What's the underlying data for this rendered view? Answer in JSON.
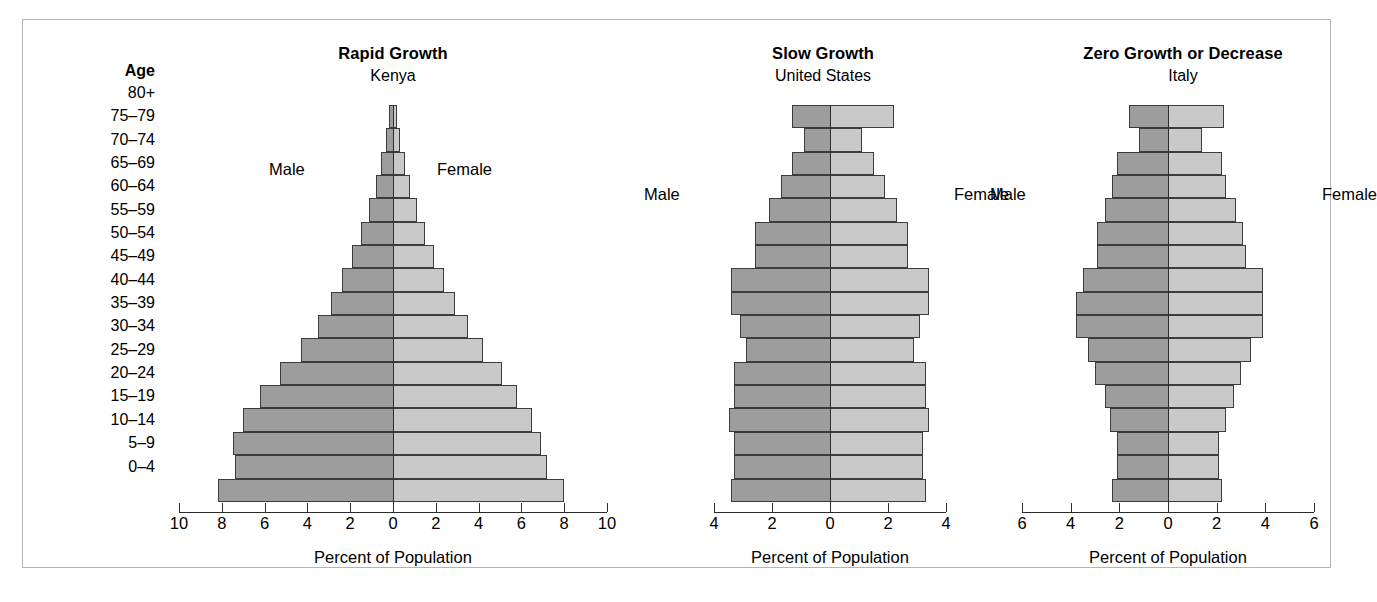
{
  "figure": {
    "age_heading": "Age",
    "age_groups": [
      "80+",
      "75–79",
      "70–74",
      "65–69",
      "60–64",
      "55–59",
      "50–54",
      "45–49",
      "40–44",
      "35–39",
      "30–34",
      "25–29",
      "20–24",
      "15–19",
      "10–14",
      "5–9",
      "0–4"
    ],
    "male_label": "Male",
    "female_label": "Female",
    "axis_title": "Percent of Population",
    "colors": {
      "male_fill": "#9d9d9d",
      "female_fill": "#c9c9c9",
      "bar_stroke": "#3c3c3c",
      "axis": "#2b2b2b",
      "frame": "#b5b5b5",
      "background": "#ffffff"
    }
  },
  "chart_data": [
    {
      "type": "bar",
      "title": "Rapid Growth",
      "subtitle": "Kenya",
      "xlabel": "Percent of Population",
      "ylabel": "Age",
      "orientation": "horizontal-diverging",
      "categories": [
        "80+",
        "75–79",
        "70–74",
        "65–69",
        "60–64",
        "55–59",
        "50–54",
        "45–49",
        "40–44",
        "35–39",
        "30–34",
        "25–29",
        "20–24",
        "15–19",
        "10–14",
        "5–9",
        "0–4"
      ],
      "xlim": [
        -10,
        10
      ],
      "xticks": [
        10,
        8,
        6,
        4,
        2,
        0,
        2,
        4,
        6,
        8,
        10
      ],
      "grid": false,
      "series": [
        {
          "name": "Male",
          "side": "left",
          "values": [
            0.2,
            0.35,
            0.55,
            0.8,
            1.1,
            1.5,
            1.9,
            2.4,
            2.9,
            3.5,
            4.3,
            5.3,
            6.2,
            7.0,
            7.5,
            7.4,
            8.2
          ]
        },
        {
          "name": "Female",
          "side": "right",
          "values": [
            0.2,
            0.35,
            0.55,
            0.8,
            1.1,
            1.5,
            1.9,
            2.4,
            2.9,
            3.5,
            4.2,
            5.1,
            5.8,
            6.5,
            6.9,
            7.2,
            8.0
          ]
        }
      ]
    },
    {
      "type": "bar",
      "title": "Slow Growth",
      "subtitle": "United States",
      "xlabel": "Percent of Population",
      "ylabel": "Age",
      "orientation": "horizontal-diverging",
      "categories": [
        "80+",
        "75–79",
        "70–74",
        "65–69",
        "60–64",
        "55–59",
        "50–54",
        "45–49",
        "40–44",
        "35–39",
        "30–34",
        "25–29",
        "20–24",
        "15–19",
        "10–14",
        "5–9",
        "0–4"
      ],
      "xlim": [
        -4,
        4
      ],
      "xticks": [
        4,
        2,
        0,
        2,
        4
      ],
      "grid": false,
      "series": [
        {
          "name": "Male",
          "side": "left",
          "values": [
            1.3,
            0.9,
            1.3,
            1.7,
            2.1,
            2.6,
            2.6,
            3.4,
            3.4,
            3.1,
            2.9,
            3.3,
            3.3,
            3.5,
            3.3,
            3.3,
            3.4
          ]
        },
        {
          "name": "Female",
          "side": "right",
          "values": [
            2.2,
            1.1,
            1.5,
            1.9,
            2.3,
            2.7,
            2.7,
            3.4,
            3.4,
            3.1,
            2.9,
            3.3,
            3.3,
            3.4,
            3.2,
            3.2,
            3.3
          ]
        }
      ]
    },
    {
      "type": "bar",
      "title": "Zero Growth or Decrease",
      "subtitle": "Italy",
      "xlabel": "Percent of Population",
      "ylabel": "Age",
      "orientation": "horizontal-diverging",
      "categories": [
        "80+",
        "75–79",
        "70–74",
        "65–69",
        "60–64",
        "55–59",
        "50–54",
        "45–49",
        "40–44",
        "35–39",
        "30–34",
        "25–29",
        "20–24",
        "15–19",
        "10–14",
        "5–9",
        "0–4"
      ],
      "xlim": [
        -6,
        6
      ],
      "xticks": [
        6,
        4,
        2,
        0,
        2,
        4,
        6
      ],
      "grid": false,
      "series": [
        {
          "name": "Male",
          "side": "left",
          "values": [
            1.6,
            1.2,
            2.1,
            2.3,
            2.6,
            2.9,
            2.9,
            3.5,
            3.8,
            3.8,
            3.3,
            3.0,
            2.6,
            2.4,
            2.1,
            2.1,
            2.3
          ]
        },
        {
          "name": "Female",
          "side": "right",
          "values": [
            2.3,
            1.4,
            2.2,
            2.4,
            2.8,
            3.1,
            3.2,
            3.9,
            3.9,
            3.9,
            3.4,
            3.0,
            2.7,
            2.4,
            2.1,
            2.1,
            2.2
          ]
        }
      ]
    }
  ]
}
